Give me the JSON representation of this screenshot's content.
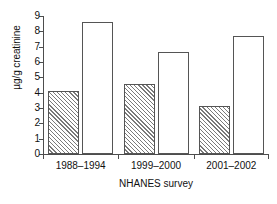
{
  "chart_data": {
    "type": "bar",
    "title": "",
    "xlabel": "NHANES survey",
    "ylabel": "µg/g creatinine",
    "categories": [
      "1988–1994",
      "1999–2000",
      "2001–2002"
    ],
    "series": [
      {
        "name": "hatched",
        "fill": "diagonal-hatch",
        "values": [
          4.1,
          4.55,
          3.15
        ]
      },
      {
        "name": "open",
        "fill": "white",
        "values": [
          8.6,
          6.65,
          7.7
        ]
      }
    ],
    "ylim": [
      0,
      9
    ],
    "ytick_labels": [
      "0",
      "1",
      "2",
      "3",
      "4",
      "5",
      "6",
      "7",
      "8",
      "9"
    ],
    "ytick_values": [
      0,
      1,
      2,
      3,
      4,
      5,
      6,
      7,
      8,
      9
    ],
    "grid": false,
    "legend": "none",
    "axis_color": "#4d4d4d",
    "bar_edge_color": "#555555",
    "hatch_color": "#7a7a7a",
    "background": "#ffffff"
  }
}
